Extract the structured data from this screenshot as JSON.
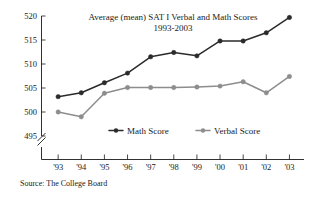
{
  "chart_data": {
    "type": "line",
    "title": "Average (mean) SAT I Verbal and Math Scores",
    "subtitle": "1993-2003",
    "xlabel": "",
    "ylabel": "",
    "categories": [
      "'93",
      "'94",
      "'95",
      "'96",
      "'97",
      "'98",
      "'99",
      "'00",
      "'01",
      "'02",
      "'03"
    ],
    "series": [
      {
        "name": "Math Score",
        "color": "#2b2b2b",
        "values": [
          503.2,
          504.0,
          506.1,
          508.1,
          511.5,
          512.4,
          511.7,
          514.8,
          514.8,
          516.5,
          519.7
        ]
      },
      {
        "name": "Verbal Score",
        "color": "#8d8d8d",
        "values": [
          500.0,
          499.0,
          503.9,
          505.1,
          505.1,
          505.1,
          505.2,
          505.4,
          506.3,
          504.0,
          507.4
        ]
      }
    ],
    "ylim": [
      495,
      520
    ],
    "yticks": [
      495,
      500,
      505,
      510,
      515,
      520
    ],
    "ytick_labels": [
      "495",
      "500",
      "505",
      "510",
      "515",
      "520"
    ],
    "grid": false,
    "axis_break": true,
    "legend_position": "inside-bottom-center",
    "source": "Source: The College Board"
  },
  "legend": {
    "items": [
      {
        "label": "Math Score",
        "color": "#2b2b2b"
      },
      {
        "label": "Verbal Score",
        "color": "#8d8d8d"
      }
    ]
  }
}
